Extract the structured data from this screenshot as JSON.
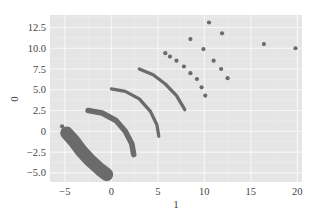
{
  "chart_data": {
    "type": "scatter",
    "title": "",
    "xlabel": "1",
    "ylabel": "0",
    "xlim": [
      -6.6,
      20.5
    ],
    "ylim": [
      -6.1,
      14.0
    ],
    "grid": true,
    "legend": null,
    "x_ticks": [
      -5,
      0,
      5,
      10,
      15,
      20
    ],
    "x_tick_labels": [
      "−5",
      "0",
      "5",
      "10",
      "15",
      "20"
    ],
    "y_ticks": [
      -5.0,
      -2.5,
      0,
      2.5,
      5.0,
      7.5,
      10.0,
      12.5
    ],
    "y_tick_labels": [
      "−5.0",
      "−2.5",
      "0",
      "2.5",
      "5.0",
      "7.5",
      "10.0",
      "12.5"
    ],
    "colors": {
      "background": "#e5e5e5",
      "grid": "#f7f7f7",
      "points": "#6b6b6b"
    },
    "series": [
      {
        "name": "cluster-band-1",
        "kind": "dense-band",
        "width": 1.4,
        "path": [
          [
            -4.8,
            -0.2
          ],
          [
            -4.0,
            -1.2
          ],
          [
            -3.2,
            -2.4
          ],
          [
            -2.2,
            -3.6
          ],
          [
            -1.2,
            -4.6
          ],
          [
            -0.5,
            -5.2
          ]
        ],
        "extra_points": [
          [
            -5.3,
            0.6
          ],
          [
            -5.1,
            0.2
          ],
          [
            -0.4,
            -5.7
          ]
        ]
      },
      {
        "name": "cluster-band-2",
        "kind": "dense-band",
        "width": 0.6,
        "path": [
          [
            -2.5,
            2.5
          ],
          [
            -1.0,
            2.2
          ],
          [
            0.5,
            1.3
          ],
          [
            1.5,
            0.0
          ],
          [
            2.2,
            -1.5
          ],
          [
            2.4,
            -2.8
          ]
        ]
      },
      {
        "name": "arc-3",
        "kind": "arc",
        "width": 0.35,
        "path": [
          [
            0.0,
            5.1
          ],
          [
            1.5,
            4.8
          ],
          [
            3.0,
            3.9
          ],
          [
            4.2,
            2.4
          ],
          [
            4.9,
            0.8
          ],
          [
            5.1,
            -0.6
          ]
        ]
      },
      {
        "name": "arc-4",
        "kind": "arc",
        "width": 0.35,
        "path": [
          [
            3.0,
            7.5
          ],
          [
            4.5,
            6.8
          ],
          [
            5.8,
            5.7
          ],
          [
            7.0,
            4.3
          ],
          [
            7.9,
            2.6
          ]
        ]
      },
      {
        "name": "outliers",
        "kind": "points",
        "points": [
          [
            10.5,
            13.1
          ],
          [
            11.9,
            11.8
          ],
          [
            8.5,
            11.1
          ],
          [
            9.9,
            9.9
          ],
          [
            5.8,
            9.4
          ],
          [
            6.3,
            9.0
          ],
          [
            7.0,
            8.5
          ],
          [
            7.8,
            7.8
          ],
          [
            11.0,
            8.5
          ],
          [
            8.5,
            7.0
          ],
          [
            11.8,
            7.5
          ],
          [
            9.2,
            6.3
          ],
          [
            12.5,
            6.4
          ],
          [
            9.7,
            5.3
          ],
          [
            10.1,
            4.3
          ],
          [
            16.4,
            10.5
          ],
          [
            19.8,
            10.0
          ]
        ]
      }
    ]
  }
}
